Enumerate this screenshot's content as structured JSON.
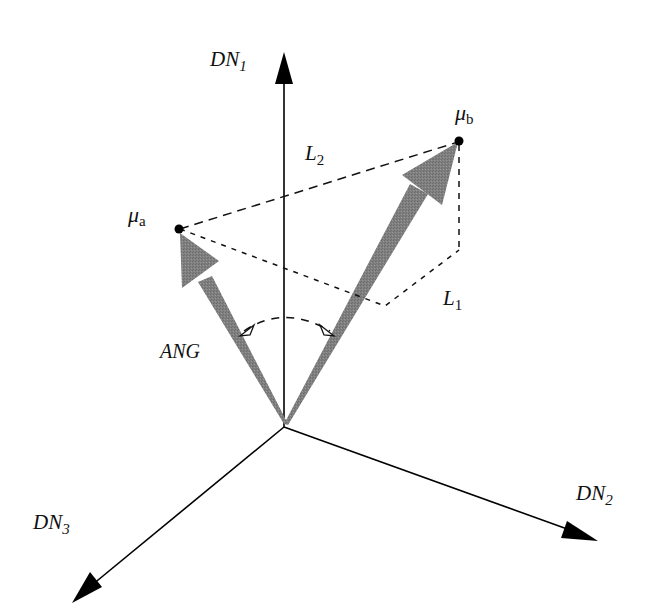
{
  "diagram": {
    "type": "3d-vector-spectral-angle",
    "colors": {
      "axis": "#000000",
      "vector_fill": "#7a7a7a",
      "dashed": "#111111",
      "background": "#ffffff"
    },
    "axes": [
      {
        "id": "dn1",
        "label": "DN",
        "subscript": "1"
      },
      {
        "id": "dn2",
        "label": "DN",
        "subscript": "2"
      },
      {
        "id": "dn3",
        "label": "DN",
        "subscript": "3"
      }
    ],
    "points": [
      {
        "id": "mu_a",
        "symbol": "μ",
        "subscript": "a"
      },
      {
        "id": "mu_b",
        "symbol": "μ",
        "subscript": "b"
      }
    ],
    "distances": [
      {
        "id": "l1",
        "label": "L",
        "subscript": "1"
      },
      {
        "id": "l2",
        "label": "L",
        "subscript": "2"
      }
    ],
    "angle_label": "ANG"
  }
}
